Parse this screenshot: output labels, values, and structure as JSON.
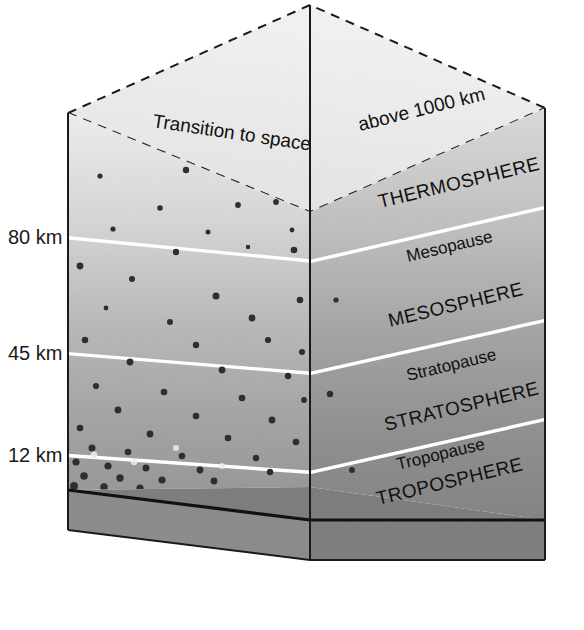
{
  "figure": {
    "projection": "isometric-block",
    "background_color": "#ffffff"
  },
  "altitude_axis": {
    "name": "altitude-scale",
    "unit": "km",
    "ticks": [
      {
        "label": "80 km",
        "value": 80
      },
      {
        "label": "45 km",
        "value": 45
      },
      {
        "label": "12 km",
        "value": 12
      }
    ]
  },
  "top_notes": [
    {
      "name": "transition-to-space",
      "text": "Transition to space"
    },
    {
      "name": "above-1000-km",
      "text": "above 1000 km"
    }
  ],
  "layers": [
    {
      "name": "thermosphere",
      "label": "THERMOSPHERE",
      "kind": "sphere",
      "base_km": 80,
      "fill": "#c9c9c9"
    },
    {
      "name": "mesopause",
      "label": "Mesopause",
      "kind": "pause",
      "altitude_km": 80
    },
    {
      "name": "mesosphere",
      "label": "MESOSPHERE",
      "kind": "sphere",
      "base_km": 45,
      "fill": "#b4b4b4"
    },
    {
      "name": "stratopause",
      "label": "Stratopause",
      "kind": "pause",
      "altitude_km": 45
    },
    {
      "name": "stratosphere",
      "label": "STRATOSPHERE",
      "kind": "sphere",
      "base_km": 12,
      "fill": "#a0a0a0"
    },
    {
      "name": "tropopause",
      "label": "Tropopause",
      "kind": "pause",
      "altitude_km": 12
    },
    {
      "name": "troposphere",
      "label": "TROPOSPHERE",
      "kind": "sphere",
      "base_km": 0,
      "fill": "#8f8f8f"
    }
  ],
  "colors": {
    "front_top": "#ececec",
    "front_bottom": "#a2a2a2",
    "right_top": "#d6d6d6",
    "right_bottom": "#8a8a8a",
    "ground_slab": "#8b8b8b",
    "boundary_line": "#ffffff",
    "outline": "#1a1a1a",
    "text": "#111111"
  },
  "particles": {
    "name": "air-molecule-dots",
    "description": "density of dots increases toward the surface",
    "color_dark": "#2b2b2b",
    "color_light": "#e9e9e9"
  }
}
